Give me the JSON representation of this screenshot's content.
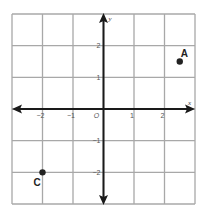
{
  "diagram": {
    "type": "coordinate-plane",
    "x_range": [
      -3,
      3
    ],
    "y_range": [
      -3,
      3
    ],
    "grid_step": 1,
    "axis_labels": {
      "x": "x",
      "y": "y"
    },
    "origin_label": "O",
    "x_ticks": [
      {
        "value": -2,
        "label": "−2"
      },
      {
        "value": -1,
        "label": "−1"
      },
      {
        "value": 1,
        "label": "1"
      },
      {
        "value": 2,
        "label": "2"
      }
    ],
    "y_ticks": [
      {
        "value": 2,
        "label": "2"
      },
      {
        "value": 1,
        "label": "1"
      },
      {
        "value": -1,
        "label": "−1"
      },
      {
        "value": -2,
        "label": "−2"
      }
    ],
    "points": [
      {
        "name": "A",
        "x": 2.5,
        "y": 1.5
      },
      {
        "name": "C",
        "x": -2,
        "y": -2
      }
    ],
    "colors": {
      "grid": "#a8a8a8",
      "axis": "#1a1a1a",
      "point": "#222222"
    }
  }
}
